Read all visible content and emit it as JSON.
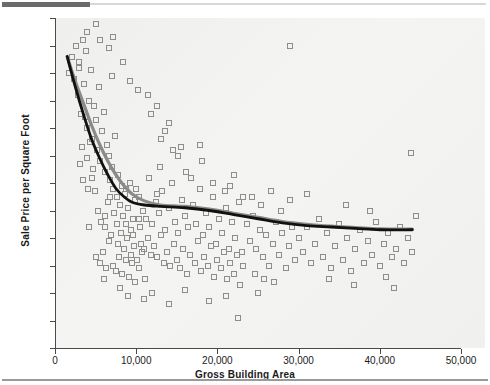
{
  "chart_data": {
    "type": "scatter",
    "title": "",
    "xlabel": "Gross Building Area",
    "ylabel": "Sale Price per Square Foot",
    "xlim": [
      0,
      50000
    ],
    "ylim": [
      0,
      120
    ],
    "xticks": [
      0,
      10000,
      20000,
      30000,
      40000,
      50000
    ],
    "xtick_labels": [
      "0",
      "10,000",
      "20,000",
      "30,000",
      "40,000",
      "50,000"
    ],
    "yticks": [
      0,
      10,
      20,
      30,
      40,
      50,
      60,
      70,
      80,
      90,
      100,
      110,
      120
    ],
    "ytick_labels": [
      "0",
      "$10",
      "$20",
      "$30",
      "$40",
      "$50",
      "$60",
      "$70",
      "$80",
      "$90",
      "$100",
      "$110",
      "$120"
    ],
    "grid": false,
    "legend": "none",
    "marker_style": "open-square",
    "marker_color": "#8d8d8d",
    "series": [
      {
        "name": "Sale Price per Square Foot vs Gross Building Area",
        "type": "scatter",
        "points": [
          [
            1700,
            100
          ],
          [
            2100,
            106
          ],
          [
            2400,
            98
          ],
          [
            2600,
            110
          ],
          [
            2800,
            92
          ],
          [
            3000,
            104
          ],
          [
            3200,
            85
          ],
          [
            3400,
            112
          ],
          [
            3600,
            96
          ],
          [
            3800,
            108
          ],
          [
            4000,
            80
          ],
          [
            4200,
            90
          ],
          [
            4400,
            101
          ],
          [
            4600,
            76
          ],
          [
            4800,
            88
          ],
          [
            5000,
            83
          ],
          [
            5200,
            72
          ],
          [
            5400,
            95
          ],
          [
            5600,
            68
          ],
          [
            5800,
            79
          ],
          [
            6000,
            86
          ],
          [
            6200,
            64
          ],
          [
            6400,
            74
          ],
          [
            6600,
            70
          ],
          [
            6800,
            61
          ],
          [
            7000,
            66
          ],
          [
            7200,
            58
          ],
          [
            7400,
            77
          ],
          [
            7600,
            55
          ],
          [
            7800,
            63
          ],
          [
            8000,
            52
          ],
          [
            8200,
            59
          ],
          [
            8400,
            48
          ],
          [
            8600,
            56
          ],
          [
            8800,
            45
          ],
          [
            9000,
            51
          ],
          [
            9200,
            60
          ],
          [
            9400,
            43
          ],
          [
            9600,
            47
          ],
          [
            9800,
            54
          ],
          [
            4500,
            62
          ],
          [
            4900,
            57
          ],
          [
            5300,
            50
          ],
          [
            5700,
            46
          ],
          [
            6100,
            44
          ],
          [
            6500,
            53
          ],
          [
            6900,
            41
          ],
          [
            7300,
            49
          ],
          [
            7700,
            38
          ],
          [
            8100,
            42
          ],
          [
            8500,
            36
          ],
          [
            8900,
            40
          ],
          [
            9300,
            34
          ],
          [
            9700,
            37
          ],
          [
            10100,
            32
          ],
          [
            10500,
            44
          ],
          [
            5100,
            33
          ],
          [
            5500,
            31
          ],
          [
            5900,
            35
          ],
          [
            6300,
            29
          ],
          [
            6700,
            39
          ],
          [
            7100,
            30
          ],
          [
            7500,
            28
          ],
          [
            7900,
            33
          ],
          [
            8300,
            27
          ],
          [
            8700,
            32
          ],
          [
            9100,
            26
          ],
          [
            9500,
            31
          ],
          [
            9900,
            24
          ],
          [
            10300,
            29
          ],
          [
            10700,
            35
          ],
          [
            11100,
            25
          ],
          [
            3100,
            67
          ],
          [
            3300,
            73
          ],
          [
            3500,
            61
          ],
          [
            3700,
            84
          ],
          [
            3900,
            69
          ],
          [
            4100,
            58
          ],
          [
            4300,
            75
          ],
          [
            4700,
            65
          ],
          [
            10000,
            58
          ],
          [
            10400,
            55
          ],
          [
            10800,
            50
          ],
          [
            11200,
            47
          ],
          [
            11600,
            62
          ],
          [
            12000,
            45
          ],
          [
            12400,
            53
          ],
          [
            12800,
            49
          ],
          [
            13200,
            57
          ],
          [
            13600,
            43
          ],
          [
            14000,
            51
          ],
          [
            14400,
            60
          ],
          [
            14800,
            46
          ],
          [
            15200,
            42
          ],
          [
            15600,
            54
          ],
          [
            16000,
            48
          ],
          [
            10600,
            38
          ],
          [
            11000,
            36
          ],
          [
            11400,
            40
          ],
          [
            11800,
            34
          ],
          [
            12200,
            37
          ],
          [
            12600,
            33
          ],
          [
            13000,
            41
          ],
          [
            13400,
            31
          ],
          [
            13800,
            35
          ],
          [
            14200,
            30
          ],
          [
            14600,
            38
          ],
          [
            15000,
            32
          ],
          [
            15400,
            29
          ],
          [
            15800,
            36
          ],
          [
            16200,
            27
          ],
          [
            16600,
            34
          ],
          [
            12500,
            88
          ],
          [
            13100,
            76
          ],
          [
            14100,
            82
          ],
          [
            15100,
            70
          ],
          [
            16100,
            64
          ],
          [
            11500,
            92
          ],
          [
            12900,
            66
          ],
          [
            14500,
            72
          ],
          [
            17000,
            52
          ],
          [
            17400,
            45
          ],
          [
            17800,
            58
          ],
          [
            18200,
            41
          ],
          [
            18600,
            49
          ],
          [
            19000,
            44
          ],
          [
            19400,
            55
          ],
          [
            19800,
            38
          ],
          [
            20200,
            47
          ],
          [
            20600,
            42
          ],
          [
            21000,
            51
          ],
          [
            21400,
            36
          ],
          [
            21800,
            46
          ],
          [
            22200,
            40
          ],
          [
            22600,
            53
          ],
          [
            23000,
            35
          ],
          [
            17200,
            31
          ],
          [
            17600,
            39
          ],
          [
            18000,
            28
          ],
          [
            18400,
            33
          ],
          [
            18800,
            30
          ],
          [
            19200,
            37
          ],
          [
            19600,
            26
          ],
          [
            20000,
            32
          ],
          [
            20400,
            29
          ],
          [
            20800,
            35
          ],
          [
            21200,
            25
          ],
          [
            21600,
            31
          ],
          [
            22000,
            27
          ],
          [
            22400,
            34
          ],
          [
            22800,
            23
          ],
          [
            23200,
            30
          ],
          [
            16800,
            62
          ],
          [
            18100,
            68
          ],
          [
            19500,
            60
          ],
          [
            20900,
            57
          ],
          [
            22100,
            63
          ],
          [
            17900,
            74
          ],
          [
            21500,
            59
          ],
          [
            23100,
            55
          ],
          [
            23600,
            45
          ],
          [
            24000,
            39
          ],
          [
            24400,
            48
          ],
          [
            24800,
            36
          ],
          [
            25200,
            43
          ],
          [
            25600,
            33
          ],
          [
            26000,
            41
          ],
          [
            26400,
            30
          ],
          [
            26800,
            38
          ],
          [
            27200,
            46
          ],
          [
            27600,
            34
          ],
          [
            28000,
            42
          ],
          [
            28400,
            29
          ],
          [
            28800,
            37
          ],
          [
            29200,
            44
          ],
          [
            29600,
            32
          ],
          [
            24200,
            55
          ],
          [
            25400,
            52
          ],
          [
            26600,
            57
          ],
          [
            27800,
            50
          ],
          [
            29000,
            54
          ],
          [
            24600,
            27
          ],
          [
            25800,
            25
          ],
          [
            27000,
            24
          ],
          [
            30000,
            40
          ],
          [
            30500,
            35
          ],
          [
            31000,
            44
          ],
          [
            31500,
            31
          ],
          [
            32000,
            38
          ],
          [
            32500,
            47
          ],
          [
            33000,
            33
          ],
          [
            33500,
            42
          ],
          [
            34000,
            29
          ],
          [
            34500,
            37
          ],
          [
            35000,
            45
          ],
          [
            35500,
            32
          ],
          [
            36000,
            40
          ],
          [
            36500,
            28
          ],
          [
            37000,
            36
          ],
          [
            37500,
            43
          ],
          [
            38000,
            31
          ],
          [
            38500,
            39
          ],
          [
            39000,
            34
          ],
          [
            39500,
            46
          ],
          [
            40000,
            30
          ],
          [
            40500,
            38
          ],
          [
            41000,
            42
          ],
          [
            41500,
            33
          ],
          [
            42000,
            36
          ],
          [
            42500,
            44
          ],
          [
            43000,
            31
          ],
          [
            43500,
            40
          ],
          [
            44000,
            35
          ],
          [
            44500,
            48
          ],
          [
            43800,
            71
          ],
          [
            41800,
            22
          ],
          [
            29000,
            110
          ],
          [
            22500,
            11
          ],
          [
            31000,
            56
          ],
          [
            35800,
            52
          ],
          [
            38800,
            50
          ],
          [
            33800,
            25
          ],
          [
            36800,
            23
          ],
          [
            40800,
            26
          ],
          [
            5000,
            118
          ],
          [
            3900,
            115
          ],
          [
            7200,
            113
          ],
          [
            4200,
            44
          ],
          [
            6000,
            25
          ],
          [
            8000,
            22
          ],
          [
            9000,
            19
          ],
          [
            11000,
            18
          ],
          [
            12000,
            20
          ],
          [
            14000,
            16
          ],
          [
            16000,
            21
          ],
          [
            19000,
            17
          ],
          [
            21000,
            19
          ],
          [
            25000,
            20
          ],
          [
            5600,
            112
          ],
          [
            2900,
            102
          ],
          [
            6600,
            109
          ],
          [
            8400,
            104
          ],
          [
            7000,
            99
          ],
          [
            9200,
            97
          ],
          [
            10200,
            94
          ],
          [
            11800,
            85
          ],
          [
            13500,
            79
          ],
          [
            15500,
            73
          ],
          [
            6200,
            48
          ],
          [
            6800,
            55
          ],
          [
            7600,
            45
          ],
          [
            8800,
            58
          ],
          [
            9600,
            41
          ],
          [
            10400,
            47
          ],
          [
            12600,
            56
          ],
          [
            16400,
            44
          ]
        ]
      },
      {
        "name": "smoothing-curve-dark",
        "type": "line",
        "color": "#111111",
        "points": [
          [
            1500,
            106
          ],
          [
            2500,
            95
          ],
          [
            3500,
            85
          ],
          [
            4500,
            76
          ],
          [
            5500,
            69
          ],
          [
            6500,
            63
          ],
          [
            7500,
            58
          ],
          [
            8500,
            55
          ],
          [
            9500,
            53
          ],
          [
            11000,
            52
          ],
          [
            13000,
            51.5
          ],
          [
            16000,
            51
          ],
          [
            19000,
            50
          ],
          [
            22000,
            48.5
          ],
          [
            25000,
            47
          ],
          [
            28000,
            45.5
          ],
          [
            31000,
            44.5
          ],
          [
            34000,
            44
          ],
          [
            37000,
            43.5
          ],
          [
            40000,
            43
          ],
          [
            44000,
            43
          ]
        ]
      },
      {
        "name": "smoothing-curve-gray",
        "type": "line",
        "color": "#8a8a8a",
        "points": [
          [
            1500,
            106
          ],
          [
            2500,
            97
          ],
          [
            3500,
            89
          ],
          [
            4500,
            81
          ],
          [
            5500,
            74
          ],
          [
            6500,
            68
          ],
          [
            7500,
            63
          ],
          [
            8500,
            59
          ],
          [
            9500,
            56
          ],
          [
            11000,
            53.5
          ],
          [
            13000,
            52
          ],
          [
            16000,
            51.5
          ],
          [
            19000,
            50.5
          ],
          [
            22000,
            49
          ],
          [
            25000,
            47.5
          ],
          [
            28000,
            46
          ],
          [
            31000,
            45
          ],
          [
            34000,
            44.3
          ],
          [
            37000,
            43.8
          ],
          [
            40000,
            43.3
          ],
          [
            44000,
            43.2
          ]
        ]
      }
    ]
  }
}
